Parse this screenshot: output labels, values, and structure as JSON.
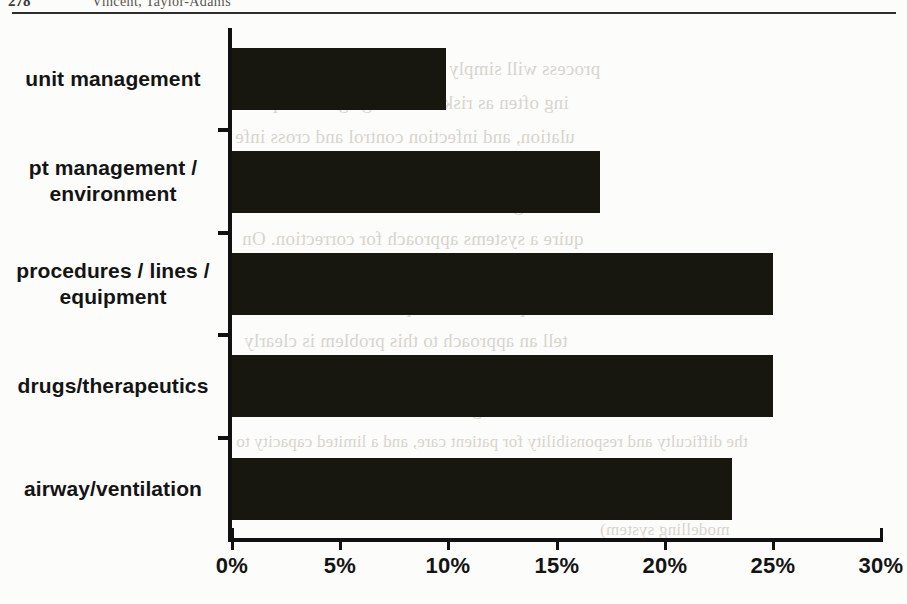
{
  "page": {
    "folio": "278",
    "running_head": "Vincent, Taylor-Adams"
  },
  "bleed_text": [
    "process will simply be irritating or suspect, a",
    "ing often as risk knowledge grows expone",
    "ulation, and infection control and cross infe",
    "on problems, there are literally hundreds of",
    "of using are as individual as the clinicians",
    "quire a systems approach for correction. On",
    "ideas around patient safety and adverse ev",
    "unhelpful but it is a poor excuse that we",
    "tell an approach to this problem is clearly",
    "would not be acceptable in any other settin",
    "of reducing risk has to balance the need",
    "the difficulty and responsibility for patient care, and a limited capacity to",
    "respectability and professionalism",
    "modelling system)"
  ],
  "chart_data": {
    "type": "bar",
    "orientation": "horizontal",
    "title": "",
    "xlabel": "",
    "ylabel": "",
    "categories": [
      "unit management",
      "pt management / environment",
      "procedures / lines / equipment",
      "drugs/therapeutics",
      "airway/ventilation"
    ],
    "values": [
      9.9,
      17.0,
      25.0,
      25.0,
      23.1
    ],
    "xlim": [
      0,
      30
    ],
    "xticks": [
      0,
      5,
      10,
      15,
      20,
      25,
      30
    ],
    "xtick_labels": [
      "0%",
      "5%",
      "10%",
      "15%",
      "20%",
      "25%",
      "30%"
    ],
    "grid": false,
    "legend": null,
    "bar_color": "#17160f",
    "axis_color": "#111111"
  }
}
